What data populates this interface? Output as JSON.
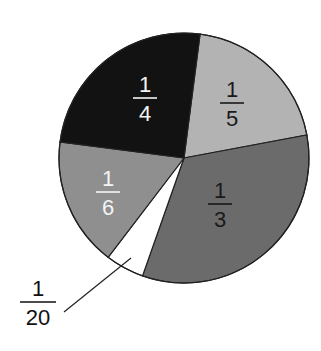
{
  "chart_data": {
    "type": "pie",
    "title": "",
    "start_angle_deg": 7.4,
    "direction": "clockwise",
    "center": [
      184,
      158
    ],
    "radius": 125,
    "slices": [
      {
        "label_num": "1",
        "label_den": "5",
        "value": 0.2,
        "fraction": "1/5",
        "color": "#b3b3b3",
        "text_color": "#1a1a1a",
        "label_pos": [
          232,
          103
        ]
      },
      {
        "label_num": "1",
        "label_den": "3",
        "value": 0.3333,
        "fraction": "1/3",
        "color": "#6b6b6b",
        "text_color": "#1a1a1a",
        "label_pos": [
          220,
          204
        ]
      },
      {
        "label_num": "1",
        "label_den": "20",
        "value": 0.05,
        "fraction": "1/20",
        "color": "#ffffff",
        "text_color": "#111111",
        "label_pos": [
          38,
          302
        ],
        "leader": [
          [
            64,
            312
          ],
          [
            131,
            258
          ]
        ]
      },
      {
        "label_num": "1",
        "label_den": "6",
        "value": 0.1667,
        "fraction": "1/6",
        "color": "#8f8f8f",
        "text_color": "#f4f4f4",
        "label_pos": [
          108,
          192
        ]
      },
      {
        "label_num": "1",
        "label_den": "4",
        "value": 0.25,
        "fraction": "1/4",
        "color": "#121212",
        "text_color": "#f4f4f4",
        "label_pos": [
          145,
          98
        ]
      }
    ],
    "legend": "none",
    "grid": false
  }
}
